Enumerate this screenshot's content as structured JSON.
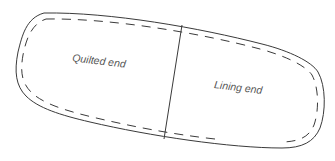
{
  "diagram": {
    "type": "sewing-pattern-piece",
    "sections": [
      {
        "label": "Quilted end"
      },
      {
        "label": "Lining end"
      }
    ],
    "colors": {
      "line": "#3a3a3a",
      "label": "#555555",
      "background": "#ffffff"
    }
  }
}
